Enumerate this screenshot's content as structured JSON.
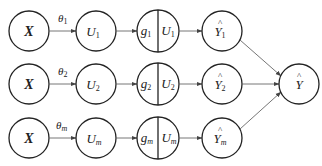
{
  "diagram": {
    "type": "ensemble-flow",
    "rows": [
      {
        "input": {
          "label": "X"
        },
        "param": {
          "symbol": "θ",
          "sub": "1"
        },
        "u": {
          "symbol": "U",
          "sub": "1"
        },
        "split": {
          "left_symbol": "g",
          "left_sub": "1",
          "right_symbol": "U",
          "right_sub": "1"
        },
        "output": {
          "symbol": "Y",
          "sub": "1",
          "hat": "^"
        }
      },
      {
        "input": {
          "label": "X"
        },
        "param": {
          "symbol": "θ",
          "sub": "2"
        },
        "u": {
          "symbol": "U",
          "sub": "2"
        },
        "split": {
          "left_symbol": "g",
          "left_sub": "2",
          "right_symbol": "U",
          "right_sub": "2"
        },
        "output": {
          "symbol": "Y",
          "sub": "2",
          "hat": "^"
        }
      },
      {
        "input": {
          "label": "X"
        },
        "param": {
          "symbol": "θ",
          "sub": "m"
        },
        "u": {
          "symbol": "U",
          "sub": "m"
        },
        "split": {
          "left_symbol": "g",
          "left_sub": "m",
          "right_symbol": "U",
          "right_sub": "m"
        },
        "output": {
          "symbol": "Y",
          "sub": "m",
          "hat": "^"
        }
      }
    ],
    "final": {
      "symbol": "Y",
      "hat": "^"
    },
    "colors": {
      "node_stroke": "#222222",
      "edge": "#666666",
      "background": "#ffffff"
    }
  }
}
